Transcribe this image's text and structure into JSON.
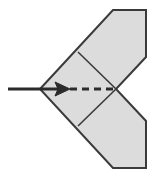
{
  "figure": {
    "width": 156,
    "height": 178,
    "background_color": "#ffffff"
  },
  "style": {
    "paper_fill": "#dcdcdc",
    "paper_outline": "#3a3a3a",
    "outline_width": 2,
    "fold_line_color": "#3a3a3a",
    "fold_line_width": 1.6,
    "arrow_color": "#2b2b2b",
    "arrow_width": 3,
    "dash_color": "#2b2b2b",
    "dash_width": 3,
    "dash_pattern": "7 5"
  },
  "shapes": {
    "paper_outline_points": "40,89 113,10 146,10 146,57 116,89 146,121 146,168 113,168",
    "fold_line_upper": {
      "x1": 78,
      "y1": 52,
      "x2": 116,
      "y2": 89
    },
    "fold_line_lower": {
      "x1": 78,
      "y1": 126,
      "x2": 116,
      "y2": 89
    }
  },
  "annotations": {
    "arrow": {
      "label": "fold direction arrow",
      "shaft_start_x": 8,
      "shaft_end_x": 60,
      "tip_x": 70,
      "y": 89,
      "head_half_height": 7
    },
    "dashed_fold_line": {
      "label": "valley fold crease",
      "x1": 70,
      "x2": 116,
      "y": 89
    }
  }
}
